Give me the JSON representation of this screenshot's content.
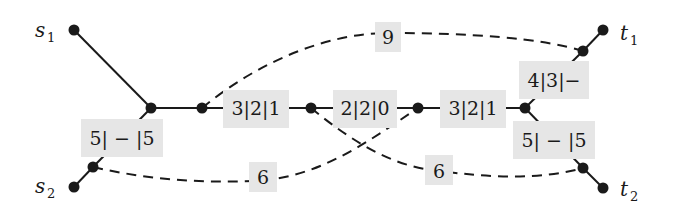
{
  "diagram": {
    "terminals": {
      "s1": {
        "name": "s",
        "sub": "1"
      },
      "s2": {
        "name": "s",
        "sub": "2"
      },
      "t1": {
        "name": "t",
        "sub": "1"
      },
      "t2": {
        "name": "t",
        "sub": "2"
      }
    },
    "edge_labels": {
      "s2_junction": "5| − |5",
      "main_1": "3|2|1",
      "main_2": "2|2|0",
      "main_3": "3|2|1",
      "t1_branch": "4|3|−",
      "t2_branch": "5| − |5",
      "dashed_top": "9",
      "dashed_bottom_left": "6",
      "dashed_bottom_right": "6"
    }
  }
}
